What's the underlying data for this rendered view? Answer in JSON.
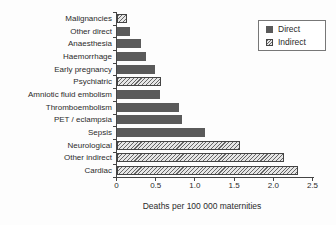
{
  "chart_data": {
    "type": "bar",
    "orientation": "horizontal",
    "categories": [
      "Malignancies",
      "Other direct",
      "Anaesthesia",
      "Haemorrhage",
      "Early pregnancy",
      "Psychiatric",
      "Amniotic fluid embolism",
      "Thromboembolism",
      "PET / eclampsia",
      "Sepsis",
      "Neurological",
      "Other indirect",
      "Cardiac"
    ],
    "values": [
      0.13,
      0.17,
      0.31,
      0.38,
      0.49,
      0.57,
      0.56,
      0.8,
      0.83,
      1.13,
      1.57,
      2.14,
      2.31
    ],
    "series_type": [
      "indirect",
      "direct",
      "direct",
      "direct",
      "direct",
      "indirect",
      "direct",
      "direct",
      "direct",
      "direct",
      "indirect",
      "indirect",
      "indirect"
    ],
    "xlabel": "Deaths per 100 000 maternities",
    "x_ticks": [
      "0",
      "0.5",
      "1.0",
      "1.5",
      "2.0",
      "2.5"
    ],
    "xlim": [
      0,
      2.5
    ],
    "grid": false,
    "legend_position": "top-right",
    "legend": [
      {
        "label": "Direct",
        "style": "solid"
      },
      {
        "label": "Indirect",
        "style": "hatched"
      }
    ],
    "colors": {
      "direct_fill": "#5a5a5a",
      "hatch_line": "#666666",
      "hatch_bg": "#e6e6e6",
      "axis": "#444444",
      "text": "#2b2b2b",
      "background": "#fdfdfd"
    }
  }
}
